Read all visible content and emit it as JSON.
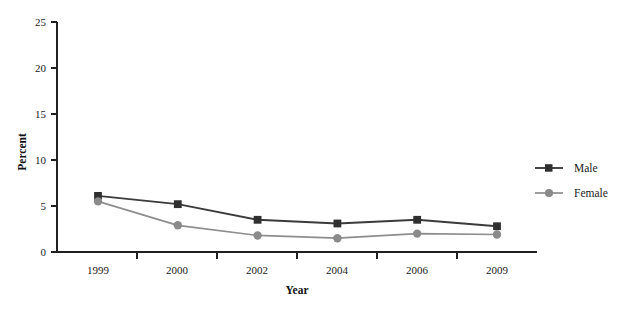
{
  "chart_data": {
    "type": "line",
    "title": "",
    "xlabel": "Year",
    "ylabel": "Percent",
    "categories": [
      "1999",
      "2000",
      "2002",
      "2004",
      "2006",
      "2009"
    ],
    "yticks": [
      0,
      5,
      10,
      15,
      20,
      25
    ],
    "ylim": [
      0,
      25
    ],
    "grid": false,
    "legend_position": "right",
    "series": [
      {
        "name": "Male",
        "color": "#2f2f2f",
        "marker": "square",
        "values": [
          6.1,
          5.2,
          3.5,
          3.1,
          3.5,
          2.8
        ]
      },
      {
        "name": "Female",
        "color": "#8a8a8a",
        "marker": "circle",
        "values": [
          5.5,
          2.9,
          1.8,
          1.5,
          2.0,
          1.9
        ]
      }
    ]
  },
  "axis": {
    "y_label": "Percent",
    "x_label": "Year",
    "y_tick_labels": [
      "0",
      "5",
      "10",
      "15",
      "20",
      "25"
    ],
    "x_tick_labels": [
      "1999",
      "2000",
      "2002",
      "2004",
      "2006",
      "2009"
    ]
  },
  "legend": {
    "entries": [
      {
        "label": "Male"
      },
      {
        "label": "Female"
      }
    ]
  }
}
